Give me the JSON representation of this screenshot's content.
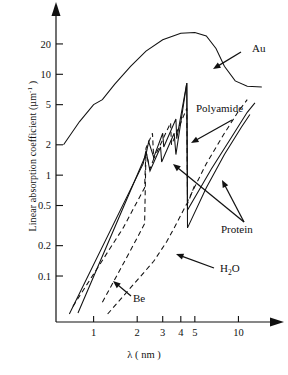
{
  "chart_data": {
    "type": "line",
    "title": "",
    "xlabel": "λ ( nm )",
    "ylabel": "Linear absorption coefficient (µm⁻¹)",
    "xscale": "log",
    "yscale": "log",
    "xlim": [
      0.55,
      16
    ],
    "ylim": [
      0.035,
      33
    ],
    "grid": false,
    "legend_position": "inline-annotations",
    "xticks": [
      "1",
      "2",
      "3",
      "4",
      "5",
      "10"
    ],
    "xtick_values": [
      1,
      2,
      3,
      4,
      5,
      10
    ],
    "yticks": [
      "20",
      "10",
      "5",
      "2",
      "1",
      "0.5",
      "0.2",
      "0.1"
    ],
    "ytick_values": [
      20,
      10,
      5,
      2,
      1,
      0.5,
      0.2,
      0.1
    ],
    "series": [
      {
        "name": "Au",
        "style": "solid",
        "points": [
          [
            0.62,
            2.0
          ],
          [
            0.8,
            3.4
          ],
          [
            1.0,
            5.0
          ],
          [
            1.15,
            5.6
          ],
          [
            1.4,
            8.0
          ],
          [
            1.8,
            12.0
          ],
          [
            2.3,
            17.0
          ],
          [
            3.0,
            22.0
          ],
          [
            4.0,
            25.5
          ],
          [
            5.0,
            26.0
          ],
          [
            6.0,
            24.0
          ],
          [
            7.0,
            18.0
          ],
          [
            8.0,
            12.0
          ],
          [
            9.5,
            8.6
          ],
          [
            11.5,
            7.6
          ],
          [
            14.5,
            7.5
          ]
        ]
      },
      {
        "name": "Polyamide",
        "style": "dashed",
        "points": [
          [
            0.72,
            0.05
          ],
          [
            1.6,
            0.3
          ],
          [
            2.25,
            0.75
          ],
          [
            2.3,
            1.85
          ],
          [
            2.55,
            2.6
          ],
          [
            2.6,
            1.45
          ],
          [
            3.4,
            3.3
          ],
          [
            3.45,
            2.0
          ],
          [
            4.4,
            4.6
          ],
          [
            4.45,
            0.55
          ],
          [
            6.0,
            1.3
          ],
          [
            8.0,
            2.6
          ],
          [
            10.0,
            4.3
          ],
          [
            11.5,
            5.6
          ]
        ]
      },
      {
        "name": "Protein",
        "style": "solid",
        "points": [
          [
            0.68,
            0.042
          ],
          [
            2.2,
            1.3
          ],
          [
            2.3,
            1.75
          ],
          [
            2.45,
            1.1
          ],
          [
            2.9,
            1.9
          ],
          [
            2.95,
            1.35
          ],
          [
            3.6,
            2.6
          ],
          [
            3.7,
            1.6
          ],
          [
            4.4,
            8.2
          ],
          [
            4.45,
            0.3
          ],
          [
            6.0,
            0.75
          ],
          [
            8.0,
            1.6
          ],
          [
            10.5,
            3.0
          ],
          [
            12.0,
            4.0
          ]
        ]
      },
      {
        "name": "Protein",
        "style": "solid",
        "points": [
          [
            0.78,
            0.043
          ],
          [
            2.3,
            1.6
          ],
          [
            2.4,
            2.15
          ],
          [
            2.6,
            1.5
          ],
          [
            3.0,
            2.6
          ],
          [
            3.05,
            1.9
          ],
          [
            3.7,
            3.6
          ],
          [
            3.75,
            2.3
          ],
          [
            4.4,
            8.2
          ],
          [
            4.45,
            0.45
          ],
          [
            6.5,
            1.15
          ],
          [
            9.0,
            2.4
          ],
          [
            11.5,
            4.2
          ],
          [
            13.0,
            5.2
          ]
        ]
      },
      {
        "name": "H2O",
        "style": "dashed",
        "points": [
          [
            1.25,
            0.042
          ],
          [
            2.6,
            0.14
          ],
          [
            3.2,
            0.22
          ],
          [
            3.6,
            0.3
          ],
          [
            4.4,
            0.52
          ],
          [
            4.45,
            0.52
          ],
          [
            5.0,
            0.8
          ]
        ]
      },
      {
        "name": "Be",
        "style": "dashed",
        "points": [
          [
            1.15,
            0.055
          ],
          [
            1.8,
            0.18
          ],
          [
            2.25,
            0.33
          ],
          [
            2.3,
            1.7
          ],
          [
            2.45,
            1.15
          ],
          [
            2.6,
            1.45
          ]
        ]
      }
    ],
    "annotations": [
      {
        "label": "Au",
        "text_xy": [
          252,
          49
        ],
        "arrow_to": [
          213,
          69
        ]
      },
      {
        "label": "Polyamide",
        "text_xy": [
          250,
          112
        ],
        "arrow_to": [
          191,
          143
        ]
      },
      {
        "label": "Protein",
        "text_xy": [
          250,
          226
        ],
        "arrow_to": [
          173,
          164
        ]
      },
      {
        "label": "Protein2",
        "text_xy": [
          250,
          226
        ],
        "arrow_to": [
          222,
          180
        ]
      },
      {
        "label": "H2O",
        "text_xy": [
          248,
          273
        ],
        "arrow_to": [
          176,
          254
        ]
      },
      {
        "label": "Be",
        "text_xy": [
          136,
          297
        ],
        "arrow_to": [
          113,
          281
        ]
      }
    ]
  },
  "labels": {
    "au": "Au",
    "polyamide": "Polyamide",
    "protein": "Protein",
    "water": "H",
    "water_sub": "2",
    "water_tail": "O",
    "be": "Be",
    "xaxis": "λ ( nm )",
    "yaxis_main": "Linear absorption coefficient (µm",
    "yaxis_exp": "-1",
    "yaxis_tail": " )"
  },
  "colors": {
    "ink": "#111111",
    "background": "#ffffff"
  }
}
